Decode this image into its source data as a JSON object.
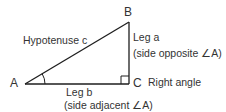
{
  "diagram": {
    "type": "right-triangle",
    "vertices": {
      "A": "A",
      "B": "B",
      "C": "C"
    },
    "labels": {
      "hypotenuse": "Hypotenuse c",
      "leg_a": "Leg a",
      "leg_a_note": "(side opposite ∠A)",
      "leg_b": "Leg b",
      "leg_b_note": "(side adjacent ∠A)",
      "right_angle": "Right angle"
    },
    "colors": {
      "line": "#1e1e1e",
      "text": "#333333",
      "background": "#ffffff"
    }
  }
}
